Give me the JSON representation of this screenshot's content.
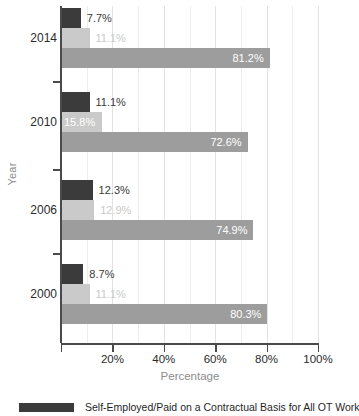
{
  "chart_data": {
    "type": "bar",
    "orientation": "horizontal",
    "title": "",
    "xlabel": "Percentage",
    "ylabel": "Year",
    "categories": [
      "2014",
      "2010",
      "2006",
      "2000"
    ],
    "xlim": [
      0,
      100
    ],
    "xticks": [
      0,
      20,
      40,
      60,
      80,
      100
    ],
    "xtick_labels": [
      "",
      "20%",
      "40%",
      "60%",
      "80%",
      "100%"
    ],
    "grid": true,
    "grid_interval": 10,
    "legend_position": "bottom",
    "series": [
      {
        "name": "Self-Employed/Paid on a Contractual Basis for All OT Work",
        "color": "#3b3b3b",
        "values": [
          7.7,
          11.1,
          12.3,
          8.7
        ],
        "labels": [
          "7.7%",
          "11.1%",
          "12.3%",
          "8.7%"
        ]
      },
      {
        "name": "",
        "color": "#cacaca",
        "values": [
          11.1,
          15.8,
          12.9,
          11.1
        ],
        "labels": [
          "11.1%",
          "15.8%",
          "12.9%",
          "11.1%"
        ]
      },
      {
        "name": "",
        "color": "#9d9d9d",
        "values": [
          81.2,
          72.6,
          74.9,
          80.3
        ],
        "labels": [
          "81.2%",
          "72.6%",
          "74.9%",
          "80.3%"
        ]
      }
    ]
  },
  "axes": {
    "x_title": "Percentage",
    "y_title": "Year",
    "x_tick_labels": [
      "20%",
      "40%",
      "60%",
      "80%",
      "100%"
    ],
    "y_tick_labels": [
      "2014",
      "2010",
      "2006",
      "2000"
    ]
  },
  "legend": {
    "items": [
      {
        "swatch": "s0",
        "label": "Self-Employed/Paid on a Contractual Basis for All OT Work"
      }
    ]
  },
  "colors": {
    "series_dark": "#3b3b3b",
    "series_light": "#cacaca",
    "series_medium": "#9d9d9d",
    "axis": "#4a4a4a",
    "grid": "#ededed",
    "muted_text": "#8d8d8d"
  }
}
